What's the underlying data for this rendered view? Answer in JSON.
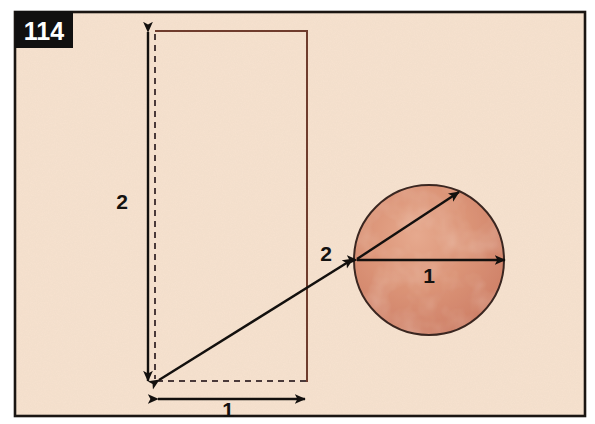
{
  "figure": {
    "plate_number": "114",
    "background_color": "#f6e2cf",
    "page_color": "#ffffff",
    "frame_border_color": "#1a1512",
    "plate_badge_color": "#111010",
    "labels": {
      "rect_height": "2",
      "rect_width": "1",
      "circle_radius_leader": "2",
      "circle_diameter": "1"
    },
    "shapes": {
      "rectangle": {
        "name": "outlined-rectangle",
        "stroke_color": "#6e3b2c",
        "x": 155,
        "y": 31,
        "width": 152,
        "height": 351
      },
      "circle": {
        "name": "textured-circle",
        "fill_color": "#d98e73",
        "stroke_color": "#3a2620",
        "center_x": 429,
        "center_y": 260,
        "radius": 75
      }
    },
    "annotations": {
      "vertical_dimension_arrow": "2",
      "horizontal_dimension_arrow": "1",
      "diagonal_leader_arrow": "2",
      "diameter_arrow": "1"
    }
  }
}
